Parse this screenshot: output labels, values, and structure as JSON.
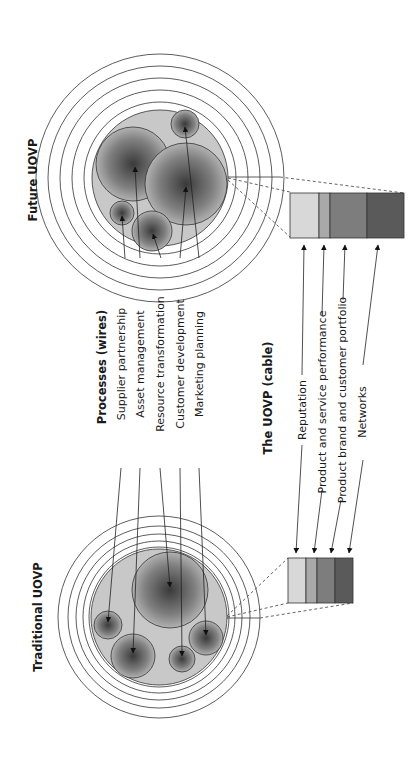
{
  "titles": {
    "future": "Future UOVP",
    "traditional": "Traditional UOVP",
    "processes": "Processes (wires)",
    "cable": "The UOVP (cable)"
  },
  "processes": [
    {
      "id": "supplier",
      "label": "Supplier partnership"
    },
    {
      "id": "asset",
      "label": "Asset management"
    },
    {
      "id": "resource",
      "label": "Resource transformation"
    },
    {
      "id": "customer",
      "label": "Customer development"
    },
    {
      "id": "marketing",
      "label": "Marketing planning"
    }
  ],
  "cable_components": [
    {
      "id": "reputation",
      "label": "Reputation",
      "color": "#d8d8d8"
    },
    {
      "id": "performance",
      "label": "Product and service performance",
      "color": "#a9a9a9"
    },
    {
      "id": "brand",
      "label": "Product brand and customer portfolio",
      "color": "#7d7d7d"
    },
    {
      "id": "networks",
      "label": "Networks",
      "color": "#5a5a5a"
    }
  ],
  "colors": {
    "core_fill": "#c8c8c8",
    "ball_center": "#3a3a3a",
    "ball_edge": "#bdbdbd",
    "stroke": "#333333"
  }
}
